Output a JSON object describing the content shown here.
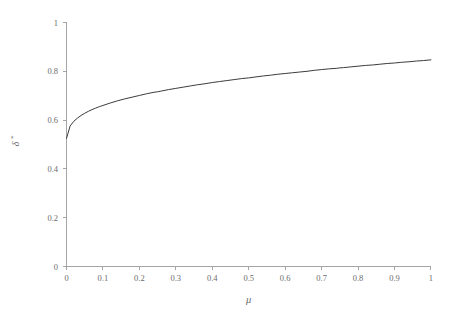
{
  "chart_data": {
    "type": "line",
    "title": "",
    "subtitle": "",
    "xlabel": "μ",
    "ylabel": "δ*",
    "ylabel_base": "δ",
    "ylabel_superscript": "*",
    "xlim": [
      0,
      1
    ],
    "ylim": [
      0,
      1
    ],
    "grid": false,
    "legend": false,
    "legend_position": "none",
    "xticks": [
      0,
      0.1,
      0.2,
      0.3,
      0.4,
      0.5,
      0.6,
      0.7,
      0.8,
      0.9,
      1
    ],
    "xticklabels": [
      "0",
      "0.1",
      "0.2",
      "0.3",
      "0.4",
      "0.5",
      "0.6",
      "0.7",
      "0.8",
      "0.9",
      "1"
    ],
    "yticks": [
      0,
      0.2,
      0.4,
      0.6,
      0.8,
      1
    ],
    "yticklabels": [
      "0",
      "0.2",
      "0.4",
      "0.6",
      "0.8",
      "1"
    ],
    "series": [
      {
        "name": "delta-star",
        "color": "#3c3c3c",
        "x": [
          0,
          0.01,
          0.02,
          0.03,
          0.04,
          0.05,
          0.06,
          0.07,
          0.08,
          0.09,
          0.1,
          0.12,
          0.14,
          0.16,
          0.18,
          0.2,
          0.22,
          0.24,
          0.25,
          0.26,
          0.28,
          0.3,
          0.32,
          0.34,
          0.36,
          0.38,
          0.4,
          0.42,
          0.44,
          0.46,
          0.48,
          0.5,
          0.52,
          0.54,
          0.56,
          0.58,
          0.6,
          0.62,
          0.64,
          0.66,
          0.68,
          0.7,
          0.72,
          0.74,
          0.75,
          0.76,
          0.78,
          0.8,
          0.82,
          0.84,
          0.86,
          0.88,
          0.9,
          0.92,
          0.94,
          0.96,
          0.98,
          1
        ],
        "y": [
          0.525,
          0.576,
          0.595,
          0.608,
          0.619,
          0.628,
          0.636,
          0.643,
          0.649,
          0.655,
          0.66,
          0.67,
          0.679,
          0.687,
          0.694,
          0.701,
          0.708,
          0.714,
          0.716,
          0.719,
          0.725,
          0.73,
          0.735,
          0.74,
          0.745,
          0.749,
          0.754,
          0.758,
          0.762,
          0.766,
          0.77,
          0.773,
          0.777,
          0.781,
          0.784,
          0.788,
          0.791,
          0.794,
          0.797,
          0.8,
          0.804,
          0.807,
          0.81,
          0.812,
          0.814,
          0.815,
          0.818,
          0.821,
          0.824,
          0.826,
          0.829,
          0.832,
          0.834,
          0.837,
          0.839,
          0.842,
          0.844,
          0.847
        ]
      }
    ],
    "note": "Monotone increasing concave curve rising from about 0.525 at mu=0 to 1.0 at mu=1"
  },
  "axes": {
    "x_axis_label": "μ",
    "y_axis_label": "δ*"
  },
  "ticks": {
    "x": [
      "0",
      "0.1",
      "0.2",
      "0.3",
      "0.4",
      "0.5",
      "0.6",
      "0.7",
      "0.8",
      "0.9",
      "1"
    ],
    "y": [
      "0",
      "0.2",
      "0.4",
      "0.6",
      "0.8",
      "1"
    ]
  },
  "style": {
    "curve_color": "#3c3c3c",
    "axis_color": "#9b9b9b",
    "text_color": "#6b6b6b",
    "background": "#ffffff"
  }
}
